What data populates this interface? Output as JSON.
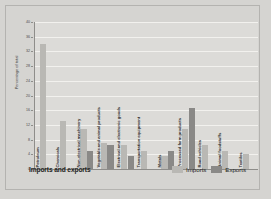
{
  "chart_data": {
    "type": "bar",
    "title": "Imports and exports",
    "xlabel": "",
    "ylabel": "Percentage of total",
    "ylim": [
      0,
      40
    ],
    "yticks": [
      0,
      4,
      8,
      12,
      16,
      20,
      24,
      28,
      32,
      36,
      40
    ],
    "grid": true,
    "legend_position": "bottom-right",
    "categories": [
      "Petroleum",
      "Chemicals",
      "Non-electrical machinery",
      "Vegetable and animal products",
      "Electrical and electronic goods",
      "Transportation equipment",
      "Metals",
      "Processed farm products",
      "Road vehicles",
      "Animal foodstuffs",
      "Textiles"
    ],
    "series": [
      {
        "name": "Imports",
        "color": "#b9b8b4",
        "values": [
          34,
          13,
          11,
          7,
          6.5,
          5,
          3.5,
          11,
          6.5,
          5,
          4
        ]
      },
      {
        "name": "Exports",
        "color": "#8a8987",
        "values": [
          0,
          0,
          5,
          6.5,
          3.5,
          0,
          5,
          16.5,
          0,
          0,
          0
        ]
      }
    ]
  },
  "legend": {
    "items": [
      {
        "label": "Imports",
        "color": "#b9b8b4"
      },
      {
        "label": "Exports",
        "color": "#8a8987"
      }
    ]
  },
  "colors": {
    "page_background": "#d5d4d1",
    "plot_background": "#dcdbd8",
    "gridline": "#f2f1ee",
    "axis": "#8e8d8a",
    "text": "#1d1d1b"
  }
}
